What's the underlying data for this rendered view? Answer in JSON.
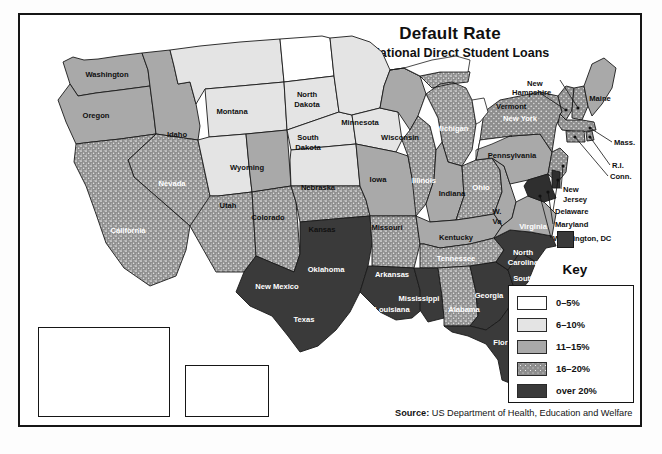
{
  "map": {
    "title": "Default Rate",
    "subtitle": "for National Direct Student Loans",
    "source_label": "Source:",
    "source_text": " US Department of Health, Education and Welfare"
  },
  "legend": {
    "title": "Key",
    "items": [
      {
        "label": "0–5%",
        "color": "#ffffff"
      },
      {
        "label": "6–10%",
        "color": "#e4e4e4"
      },
      {
        "label": "11–15%",
        "color": "#a9a9a9"
      },
      {
        "label": "16–20%",
        "color": "#8e8e8e"
      },
      {
        "label": "over 20%",
        "color": "#3a3a3a"
      }
    ]
  },
  "states": {
    "washington": {
      "label": "Washington",
      "rate_band": "11–15%"
    },
    "oregon": {
      "label": "Oregon",
      "rate_band": "11–15%"
    },
    "idaho": {
      "label": "Idaho",
      "rate_band": "11–15%"
    },
    "montana": {
      "label": "Montana",
      "rate_band": "6–10%"
    },
    "wyoming": {
      "label": "Wyoming",
      "rate_band": "6–10%"
    },
    "nevada": {
      "label": "Nevada",
      "rate_band": "16–20%"
    },
    "california": {
      "label": "California",
      "rate_band": "16–20%"
    },
    "utah": {
      "label": "Utah",
      "rate_band": "6–10%"
    },
    "colorado": {
      "label": "Colorado",
      "rate_band": "11–15%"
    },
    "arizona": {
      "label": "Arizona",
      "rate_band": "16–20%"
    },
    "new_mexico": {
      "label": "New Mexico",
      "rate_band": "16–20%"
    },
    "north_dakota": {
      "label": "North\nDakota",
      "rate_band": "0–5%"
    },
    "south_dakota": {
      "label": "South\nDakota",
      "rate_band": "6–10%"
    },
    "nebraska": {
      "label": "Nebraska",
      "rate_band": "6–10%"
    },
    "kansas": {
      "label": "Kansas",
      "rate_band": "6–10%"
    },
    "oklahoma": {
      "label": "Oklahoma",
      "rate_band": "16–20%"
    },
    "texas": {
      "label": "Texas",
      "rate_band": "over 20%"
    },
    "minnesota": {
      "label": "Minnesota",
      "rate_band": "6–10%"
    },
    "iowa": {
      "label": "Iowa",
      "rate_band": "6–10%"
    },
    "missouri": {
      "label": "Missouri",
      "rate_band": "11–15%"
    },
    "arkansas": {
      "label": "Arkansas",
      "rate_band": "16–20%"
    },
    "louisiana": {
      "label": "Louisiana",
      "rate_band": "over 20%"
    },
    "wisconsin": {
      "label": "Wisconsin",
      "rate_band": "11–15%"
    },
    "illinois": {
      "label": "Illinois",
      "rate_band": "16–20%"
    },
    "michigan": {
      "label": "Michigan",
      "rate_band": "16–20%"
    },
    "indiana": {
      "label": "Indiana",
      "rate_band": "11–15%"
    },
    "ohio": {
      "label": "Ohio",
      "rate_band": "16–20%"
    },
    "kentucky": {
      "label": "Kentucky",
      "rate_band": "11–15%"
    },
    "tennessee": {
      "label": "Tennessee",
      "rate_band": "16–20%"
    },
    "mississippi": {
      "label": "Mississippi",
      "rate_band": "over 20%"
    },
    "alabama": {
      "label": "Alabama",
      "rate_band": "16–20%"
    },
    "georgia": {
      "label": "Georgia",
      "rate_band": "over 20%"
    },
    "florida": {
      "label": "Florida",
      "rate_band": "over 20%"
    },
    "south_carolina": {
      "label": "South\nCarolina",
      "rate_band": "over 20%"
    },
    "north_carolina": {
      "label": "North\nCarolina",
      "rate_band": "over 20%"
    },
    "virginia": {
      "label": "Virginia",
      "rate_band": "11–15%"
    },
    "west_virginia": {
      "label": "W.\nVa",
      "rate_band": "11–15%"
    },
    "pennsylvania": {
      "label": "Pennsylvania",
      "rate_band": "11–15%"
    },
    "new_york": {
      "label": "New York",
      "rate_band": "16–20%"
    },
    "maine": {
      "label": "Maine",
      "rate_band": "11–15%"
    },
    "vermont": {
      "label": "Vermont",
      "rate_band": "16–20%"
    },
    "new_hampshire": {
      "label": "New\nHampshire",
      "rate_band": "16–20%"
    },
    "massachusetts": {
      "label": "Mass.",
      "rate_band": "16–20%"
    },
    "rhode_island": {
      "label": "R.I.",
      "rate_band": "16–20%"
    },
    "connecticut": {
      "label": "Conn.",
      "rate_band": "16–20%"
    },
    "new_jersey": {
      "label": "New\nJersey",
      "rate_band": "16–20%"
    },
    "delaware": {
      "label": "Delaware",
      "rate_band": "over 20%"
    },
    "maryland": {
      "label": "Maryland",
      "rate_band": "over 20%"
    },
    "washington_dc": {
      "label": "Washington, DC",
      "rate_band": "over 20%"
    },
    "alaska": {
      "label": "Alaska",
      "rate_band": "over 20%"
    },
    "hawaii": {
      "label": "Hawaii",
      "rate_band": "11–15%"
    }
  },
  "callout_labels": {
    "new_hampshire": "New\nHampshire",
    "vermont": "Vermont",
    "mass": "Mass.",
    "ri": "R.I.",
    "conn": "Conn.",
    "new_jersey": "New\nJersey",
    "delaware": "Delaware",
    "maryland": "Maryland",
    "washington_dc": "Washington, DC"
  }
}
